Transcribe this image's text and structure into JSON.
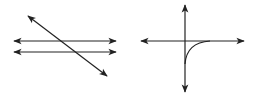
{
  "diagram": {
    "stroke_color": "#222222",
    "background": "#ffffff",
    "figures": [
      {
        "name": "transversal-parallel-lines",
        "lines": [
          {
            "role": "transversal",
            "x1": 28,
            "y1": 16,
            "x2": 107,
            "y2": 76,
            "arrows": "both"
          },
          {
            "role": "parallel-line-1",
            "x1": 14,
            "y1": 41,
            "x2": 116,
            "y2": 41,
            "arrows": "both"
          },
          {
            "role": "parallel-line-2",
            "x1": 14,
            "y1": 52,
            "x2": 116,
            "y2": 52,
            "arrows": "both"
          }
        ]
      },
      {
        "name": "axes-with-curve",
        "lines": [
          {
            "role": "vertical-axis",
            "x1": 185,
            "y1": 5,
            "x2": 185,
            "y2": 92,
            "arrows": "both"
          },
          {
            "role": "horizontal-axis",
            "x1": 141,
            "y1": 41,
            "x2": 244,
            "y2": 41,
            "arrows": "both"
          }
        ],
        "curve": {
          "role": "asymptotic-curve",
          "path": "M185,64 C186,50 194,42 210,41"
        }
      }
    ]
  }
}
